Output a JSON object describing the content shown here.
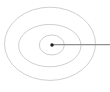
{
  "diagram": {
    "canvas": {
      "width": 110,
      "height": 92,
      "background": "#ffffff"
    },
    "colors": {
      "orbit_stroke": "#c9c9c9",
      "pointer_line": "#8f8f8f",
      "nucleus_dot": "#1c1c1c"
    },
    "orbits": [
      {
        "name": "inner-orbit",
        "cx": 51.8,
        "cy": 45.0,
        "rx": 12.5,
        "ry": 10.0,
        "stroke_width": 0.9
      },
      {
        "name": "middle-orbit",
        "cx": 49.8,
        "cy": 45.6,
        "rx": 31.2,
        "ry": 21.2,
        "stroke_width": 0.9
      },
      {
        "name": "outer-orbit",
        "cx": 50.0,
        "cy": 43.8,
        "rx": 45.5,
        "ry": 36.6,
        "stroke_width": 0.9
      }
    ],
    "nucleus_dot": {
      "cx": 52.0,
      "cy": 45.0,
      "r": 1.7
    },
    "pointer_line": {
      "x1": 53.0,
      "y1": 44.6,
      "x2": 110.0,
      "y2": 44.6,
      "stroke_width": 1.1
    }
  }
}
